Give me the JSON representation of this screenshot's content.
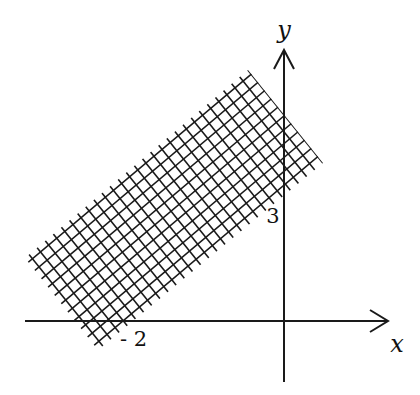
{
  "figure": {
    "width": 420,
    "height": 395,
    "stroke_color": "#1a1a1a",
    "background": "#ffffff"
  },
  "axes": {
    "origin_px": [
      284,
      321
    ],
    "x_axis": {
      "from": [
        25,
        321
      ],
      "to": [
        388,
        321
      ],
      "label": "x",
      "label_pos": [
        397,
        352
      ]
    },
    "y_axis": {
      "from": [
        284,
        382
      ],
      "to": [
        284,
        50
      ],
      "label": "y",
      "label_pos": [
        284,
        38
      ]
    }
  },
  "tick_labels": [
    {
      "text": "- 2",
      "pos": [
        120,
        346
      ],
      "meaning": "x-intercept -2"
    },
    {
      "text": "3",
      "pos": [
        273,
        223
      ],
      "meaning": "y-intercept 3"
    }
  ],
  "shaded_region": {
    "description": "Cross-hatched strip between two parallel lines through (-2,0) and (0,3)",
    "corners_px": [
      [
        248,
        70
      ],
      [
        323,
        163
      ],
      [
        98,
        350
      ],
      [
        25,
        258
      ]
    ],
    "hatch_spacing_px": 10.6,
    "hatch_stroke": 1.6
  }
}
